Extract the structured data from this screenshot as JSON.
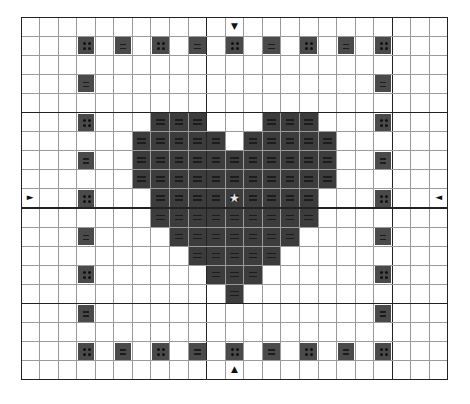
{
  "chart_data": {
    "type": "table",
    "title": "",
    "grid": {
      "columns": 23,
      "rows": 19,
      "major_cols": [
        10,
        20
      ],
      "major_rows": [
        5,
        10,
        15
      ]
    },
    "colors": {
      "background": "#ffffff",
      "fill": "#3c3c3c",
      "symbol_cell": "#4a4a4a",
      "grid_line": "#9a9a9a",
      "major_line": "#222222",
      "center_star": "#e8e8e8"
    },
    "heart_rows": [
      {
        "row": 5,
        "cols": [
          7,
          8,
          9,
          13,
          14,
          15
        ]
      },
      {
        "row": 6,
        "cols": [
          6,
          7,
          8,
          9,
          10,
          12,
          13,
          14,
          15,
          16
        ]
      },
      {
        "row": 7,
        "cols": [
          6,
          7,
          8,
          9,
          10,
          11,
          12,
          13,
          14,
          15,
          16
        ]
      },
      {
        "row": 8,
        "cols": [
          6,
          7,
          8,
          9,
          10,
          11,
          12,
          13,
          14,
          15,
          16
        ]
      },
      {
        "row": 9,
        "cols": [
          7,
          8,
          9,
          10,
          11,
          12,
          13,
          14,
          15
        ]
      },
      {
        "row": 10,
        "cols": [
          7,
          8,
          9,
          10,
          11,
          12,
          13,
          14,
          15
        ]
      },
      {
        "row": 11,
        "cols": [
          8,
          9,
          10,
          11,
          12,
          13,
          14
        ]
      },
      {
        "row": 12,
        "cols": [
          9,
          10,
          11,
          12,
          13
        ]
      },
      {
        "row": 13,
        "cols": [
          10,
          11,
          12
        ]
      },
      {
        "row": 14,
        "cols": [
          11
        ]
      }
    ],
    "heart_symbol": "lines",
    "border_cells": [
      {
        "row": 1,
        "col": 3,
        "symbol": "dots"
      },
      {
        "row": 1,
        "col": 5,
        "symbol": "lines"
      },
      {
        "row": 1,
        "col": 7,
        "symbol": "dots"
      },
      {
        "row": 1,
        "col": 9,
        "symbol": "lines"
      },
      {
        "row": 1,
        "col": 11,
        "symbol": "dots"
      },
      {
        "row": 1,
        "col": 13,
        "symbol": "lines"
      },
      {
        "row": 1,
        "col": 15,
        "symbol": "dots"
      },
      {
        "row": 1,
        "col": 17,
        "symbol": "lines"
      },
      {
        "row": 1,
        "col": 19,
        "symbol": "dots"
      },
      {
        "row": 17,
        "col": 3,
        "symbol": "dots"
      },
      {
        "row": 17,
        "col": 5,
        "symbol": "lines"
      },
      {
        "row": 17,
        "col": 7,
        "symbol": "dots"
      },
      {
        "row": 17,
        "col": 9,
        "symbol": "lines"
      },
      {
        "row": 17,
        "col": 11,
        "symbol": "dots"
      },
      {
        "row": 17,
        "col": 13,
        "symbol": "lines"
      },
      {
        "row": 17,
        "col": 15,
        "symbol": "dots"
      },
      {
        "row": 17,
        "col": 17,
        "symbol": "lines"
      },
      {
        "row": 17,
        "col": 19,
        "symbol": "dots"
      },
      {
        "row": 3,
        "col": 3,
        "symbol": "lines"
      },
      {
        "row": 5,
        "col": 3,
        "symbol": "dots"
      },
      {
        "row": 7,
        "col": 3,
        "symbol": "lines"
      },
      {
        "row": 9,
        "col": 3,
        "symbol": "dots"
      },
      {
        "row": 11,
        "col": 3,
        "symbol": "lines"
      },
      {
        "row": 13,
        "col": 3,
        "symbol": "dots"
      },
      {
        "row": 15,
        "col": 3,
        "symbol": "lines"
      },
      {
        "row": 3,
        "col": 19,
        "symbol": "lines"
      },
      {
        "row": 5,
        "col": 19,
        "symbol": "dots"
      },
      {
        "row": 7,
        "col": 19,
        "symbol": "lines"
      },
      {
        "row": 9,
        "col": 19,
        "symbol": "dots"
      },
      {
        "row": 11,
        "col": 19,
        "symbol": "lines"
      },
      {
        "row": 13,
        "col": 19,
        "symbol": "dots"
      },
      {
        "row": 15,
        "col": 19,
        "symbol": "lines"
      }
    ],
    "center_marker": {
      "row": 9,
      "col": 11,
      "glyph": "★"
    },
    "arrows": [
      {
        "row": 0,
        "col": 11,
        "glyph": "▼",
        "direction": "down"
      },
      {
        "row": 18,
        "col": 11,
        "glyph": "▲",
        "direction": "up"
      },
      {
        "row": 9,
        "col": 0,
        "glyph": "►",
        "direction": "right"
      },
      {
        "row": 9,
        "col": 22,
        "glyph": "◄",
        "direction": "left"
      }
    ]
  }
}
